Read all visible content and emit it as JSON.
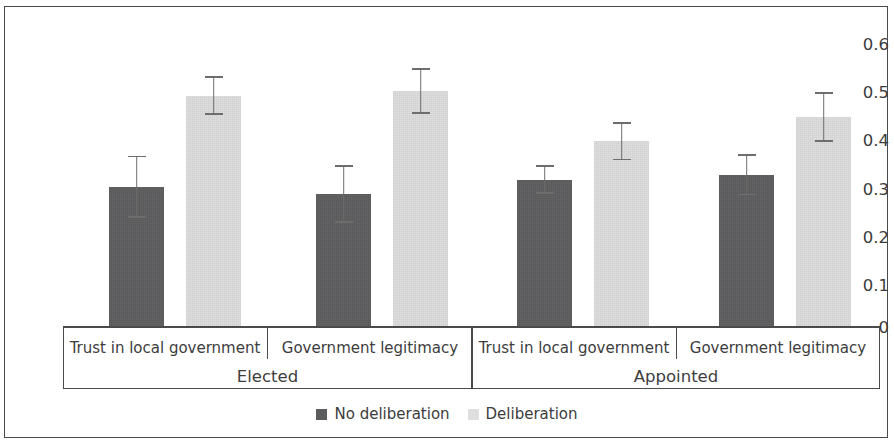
{
  "chart_data": {
    "type": "bar",
    "title": "",
    "xlabel": "",
    "ylabel": "",
    "ylim": [
      0,
      0.6
    ],
    "ytick_labels": [
      "0.6",
      "0.5",
      "0.4",
      "0.3",
      "0.2",
      "0.1",
      "0"
    ],
    "ytick_values": [
      0.6,
      0.5,
      0.4,
      0.3,
      0.2,
      0.1,
      0
    ],
    "grid": false,
    "legend_position": "bottom-center",
    "groups": [
      "Elected",
      "Appointed"
    ],
    "categories": [
      "Trust in local government",
      "Government legitimacy",
      "Trust in local government",
      "Government legitimacy"
    ],
    "series": [
      {
        "name": "No deliberation",
        "color": "#5c5c5e",
        "values": [
          0.29,
          0.275,
          0.305,
          0.315
        ],
        "errors": [
          0.065,
          0.06,
          0.03,
          0.043
        ]
      },
      {
        "name": "Deliberation",
        "color": "#dedede",
        "values": [
          0.48,
          0.49,
          0.385,
          0.435
        ],
        "errors": [
          0.04,
          0.048,
          0.04,
          0.052
        ]
      }
    ],
    "bars": [
      {
        "group": "Elected",
        "category": "Trust in local government",
        "series": "No deliberation",
        "value": 0.29,
        "error_low": 0.225,
        "error_high": 0.355
      },
      {
        "group": "Elected",
        "category": "Trust in local government",
        "series": "Deliberation",
        "value": 0.48,
        "error_low": 0.44,
        "error_high": 0.52
      },
      {
        "group": "Elected",
        "category": "Government legitimacy",
        "series": "No deliberation",
        "value": 0.275,
        "error_low": 0.215,
        "error_high": 0.335
      },
      {
        "group": "Elected",
        "category": "Government legitimacy",
        "series": "Deliberation",
        "value": 0.49,
        "error_low": 0.442,
        "error_high": 0.538
      },
      {
        "group": "Appointed",
        "category": "Trust in local government",
        "series": "No deliberation",
        "value": 0.305,
        "error_low": 0.275,
        "error_high": 0.335
      },
      {
        "group": "Appointed",
        "category": "Trust in local government",
        "series": "Deliberation",
        "value": 0.385,
        "error_low": 0.345,
        "error_high": 0.425
      },
      {
        "group": "Appointed",
        "category": "Government legitimacy",
        "series": "No deliberation",
        "value": 0.315,
        "error_low": 0.272,
        "error_high": 0.358
      },
      {
        "group": "Appointed",
        "category": "Government legitimacy",
        "series": "Deliberation",
        "value": 0.435,
        "error_low": 0.383,
        "error_high": 0.487
      }
    ]
  },
  "axis": {
    "y": {
      "t0": "0.6",
      "t1": "0.5",
      "t2": "0.4",
      "t3": "0.3",
      "t4": "0.2",
      "t5": "0.1",
      "t6": "0"
    },
    "categories": {
      "c0": "Trust in local government",
      "c1": "Government legitimacy",
      "c2": "Trust in local government",
      "c3": "Government legitimacy"
    },
    "groups": {
      "g0": "Elected",
      "g1": "Appointed"
    }
  },
  "legend": {
    "items": [
      {
        "label": "No deliberation",
        "color": "#5c5c5e"
      },
      {
        "label": "Deliberation",
        "color": "#dedede"
      }
    ],
    "item0": "No deliberation",
    "item1": "Deliberation"
  }
}
